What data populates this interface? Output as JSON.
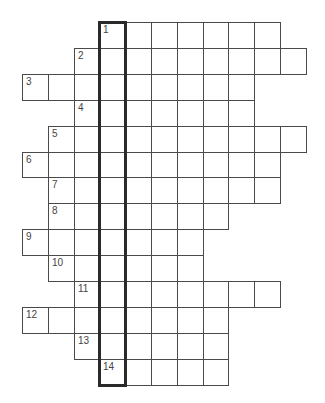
{
  "puzzle": {
    "type": "crossword",
    "columns": 11,
    "rows": 14,
    "grid_origin_x": 22,
    "grid_origin_y": 22,
    "cell_w": 25.8,
    "cell_h": 25.9,
    "highlight_column": 3,
    "highlight_label": "1",
    "entries": [
      {
        "number": "1",
        "start_col": 3,
        "length": 7
      },
      {
        "number": "2",
        "start_col": 2,
        "length": 9
      },
      {
        "number": "3",
        "start_col": 0,
        "length": 9
      },
      {
        "number": "4",
        "start_col": 2,
        "length": 7
      },
      {
        "number": "5",
        "start_col": 1,
        "length": 10
      },
      {
        "number": "6",
        "start_col": 0,
        "length": 10
      },
      {
        "number": "7",
        "start_col": 1,
        "length": 9
      },
      {
        "number": "8",
        "start_col": 1,
        "length": 7
      },
      {
        "number": "9",
        "start_col": 0,
        "length": 7
      },
      {
        "number": "10",
        "start_col": 1,
        "length": 6
      },
      {
        "number": "11",
        "start_col": 2,
        "length": 8
      },
      {
        "number": "12",
        "start_col": 0,
        "length": 8
      },
      {
        "number": "13",
        "start_col": 2,
        "length": 6
      },
      {
        "number": "14",
        "start_col": 3,
        "length": 5
      }
    ]
  }
}
